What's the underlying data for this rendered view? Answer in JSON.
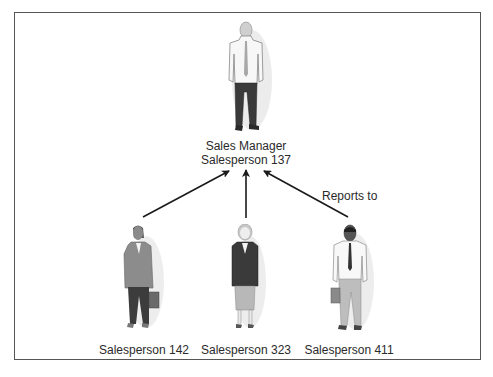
{
  "diagram": {
    "type": "org-chart",
    "manager": {
      "title": "Sales Manager",
      "name": "Salesperson 137",
      "icon": "businessman-white-shirt-tie-icon"
    },
    "edge_label": "Reports to",
    "subordinates": [
      {
        "name": "Salesperson 142",
        "icon": "businesswoman-gray-suit-briefcase-icon"
      },
      {
        "name": "Salesperson 323",
        "icon": "businesswoman-dark-jacket-skirt-icon"
      },
      {
        "name": "Salesperson 411",
        "icon": "businessman-tie-briefcase-icon"
      }
    ],
    "edges": [
      {
        "from": "Salesperson 142",
        "to": "Salesperson 137"
      },
      {
        "from": "Salesperson 323",
        "to": "Salesperson 137"
      },
      {
        "from": "Salesperson 411",
        "to": "Salesperson 137",
        "label": "Reports to"
      }
    ],
    "colors": {
      "frame": "#555555",
      "arrow": "#1a1a1a",
      "text": "#2a2a2a"
    }
  }
}
